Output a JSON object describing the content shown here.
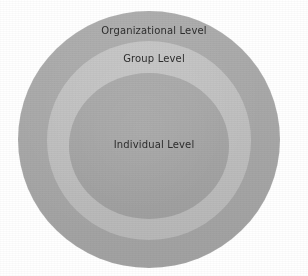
{
  "diagram": {
    "type": "concentric-circles",
    "background_color": "#ffffff",
    "text_color": "#2d2d2d",
    "levels": [
      {
        "key": "organizational",
        "label": "Organizational Level",
        "fill_color": "#a9a9a9",
        "order": 1,
        "position": "outer"
      },
      {
        "key": "group",
        "label": "Group Level",
        "fill_color": "#bfbfbf",
        "order": 2,
        "position": "middle"
      },
      {
        "key": "individual",
        "label": "Individual Level",
        "fill_color": "#a6a6a6",
        "order": 3,
        "position": "inner"
      }
    ]
  }
}
